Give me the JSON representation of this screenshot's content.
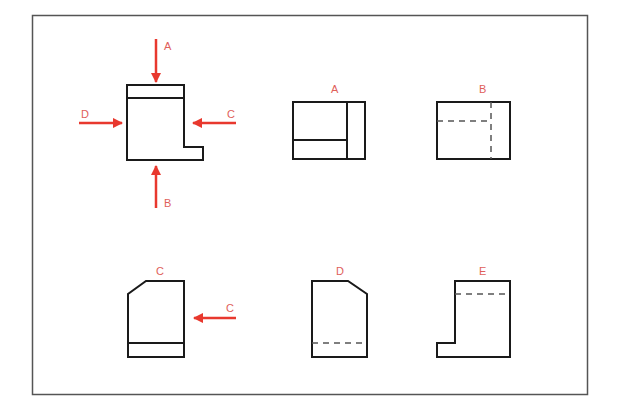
{
  "diagram": {
    "type": "orthographic-projection-exercise",
    "colors": {
      "frame": "#555555",
      "outline": "#1a1a1a",
      "hidden_line": "#555555",
      "arrow": "#e8382e",
      "label": "#e0605a"
    },
    "object_view": {
      "arrows": [
        {
          "id": "A",
          "label": "A",
          "direction": "down"
        },
        {
          "id": "B",
          "label": "B",
          "direction": "up"
        },
        {
          "id": "C",
          "label": "C",
          "direction": "left"
        },
        {
          "id": "D",
          "label": "D",
          "direction": "right"
        }
      ]
    },
    "views": [
      {
        "id": "A",
        "label": "A"
      },
      {
        "id": "B",
        "label": "B"
      },
      {
        "id": "C",
        "label": "C",
        "arrow_label": "C"
      },
      {
        "id": "D",
        "label": "D"
      },
      {
        "id": "E",
        "label": "E"
      }
    ]
  }
}
